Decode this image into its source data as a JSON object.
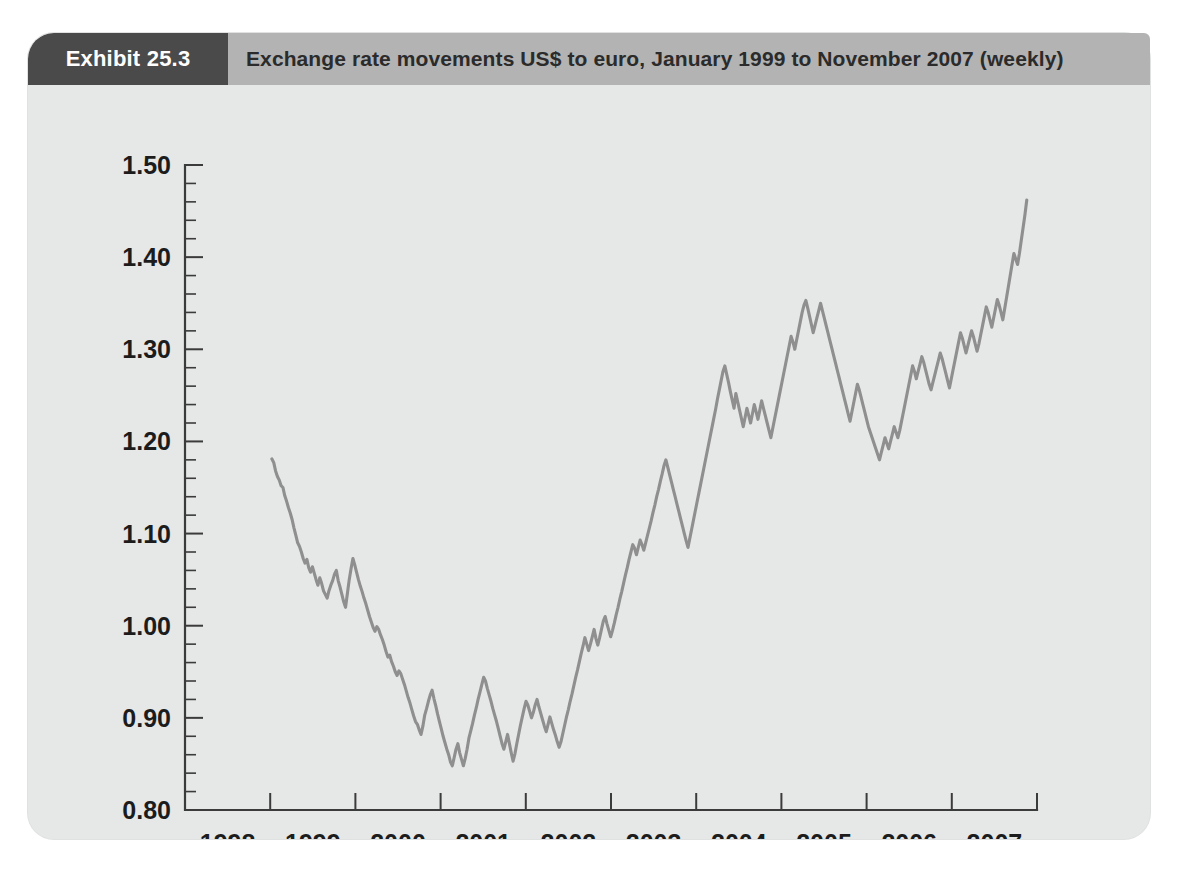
{
  "exhibit": {
    "tag_label": "Exhibit 25.3",
    "title": "Exchange rate movements US$ to euro, January 1999 to November 2007 (weekly)",
    "tag_background": "#4a4a4a",
    "header_background": "#b3b3b3",
    "panel_background": "#e6e7e7"
  },
  "chart_data": {
    "type": "line",
    "title": "Exchange rate movements US$ to euro, January 1999 to November 2007 (weekly)",
    "xlabel": "",
    "ylabel": "",
    "grid": false,
    "legend": null,
    "line_color": "#8f8f8f",
    "axis_color": "#3b3b3b",
    "xlim": [
      1998.0,
      2008.0
    ],
    "ylim": [
      0.8,
      1.5
    ],
    "x_tick_labels": [
      "1998",
      "1999",
      "2000",
      "2001",
      "2002",
      "2003",
      "2004",
      "2005",
      "2006",
      "2007"
    ],
    "x_tick_label_positions": [
      1998.5,
      1999.5,
      2000.5,
      2001.5,
      2002.5,
      2003.5,
      2004.5,
      2005.5,
      2006.5,
      2007.5
    ],
    "x_major_ticks": [
      1998,
      1999,
      2000,
      2001,
      2002,
      2003,
      2004,
      2005,
      2006,
      2007,
      2008
    ],
    "y_tick_labels": [
      "0.80",
      "0.90",
      "1.00",
      "1.10",
      "1.20",
      "1.30",
      "1.40",
      "1.50"
    ],
    "y_major_ticks": [
      0.8,
      0.9,
      1.0,
      1.1,
      1.2,
      1.3,
      1.4,
      1.5
    ],
    "y_minor_tick_step": 0.02,
    "series_name": "US$ per euro",
    "x_start": 1999.02,
    "x_end": 2007.88,
    "values": [
      1.181,
      1.177,
      1.168,
      1.162,
      1.158,
      1.152,
      1.15,
      1.141,
      1.135,
      1.128,
      1.122,
      1.115,
      1.106,
      1.098,
      1.09,
      1.086,
      1.08,
      1.073,
      1.068,
      1.072,
      1.063,
      1.058,
      1.064,
      1.057,
      1.05,
      1.044,
      1.052,
      1.046,
      1.038,
      1.034,
      1.03,
      1.038,
      1.044,
      1.049,
      1.056,
      1.06,
      1.049,
      1.042,
      1.034,
      1.026,
      1.02,
      1.035,
      1.05,
      1.062,
      1.073,
      1.066,
      1.058,
      1.05,
      1.043,
      1.037,
      1.03,
      1.024,
      1.017,
      1.01,
      1.004,
      0.998,
      0.994,
      0.999,
      0.996,
      0.99,
      0.985,
      0.979,
      0.972,
      0.966,
      0.968,
      0.961,
      0.956,
      0.95,
      0.946,
      0.951,
      0.948,
      0.942,
      0.936,
      0.929,
      0.922,
      0.916,
      0.909,
      0.902,
      0.896,
      0.893,
      0.887,
      0.882,
      0.891,
      0.903,
      0.91,
      0.918,
      0.925,
      0.93,
      0.921,
      0.913,
      0.904,
      0.896,
      0.888,
      0.88,
      0.873,
      0.866,
      0.86,
      0.852,
      0.848,
      0.857,
      0.866,
      0.872,
      0.862,
      0.855,
      0.848,
      0.856,
      0.866,
      0.878,
      0.886,
      0.894,
      0.903,
      0.911,
      0.92,
      0.928,
      0.936,
      0.944,
      0.94,
      0.932,
      0.925,
      0.918,
      0.91,
      0.903,
      0.896,
      0.888,
      0.88,
      0.872,
      0.866,
      0.874,
      0.882,
      0.872,
      0.862,
      0.853,
      0.861,
      0.872,
      0.882,
      0.892,
      0.901,
      0.91,
      0.918,
      0.914,
      0.907,
      0.9,
      0.906,
      0.914,
      0.92,
      0.912,
      0.905,
      0.898,
      0.891,
      0.885,
      0.893,
      0.901,
      0.894,
      0.887,
      0.881,
      0.874,
      0.868,
      0.874,
      0.883,
      0.892,
      0.901,
      0.909,
      0.918,
      0.926,
      0.935,
      0.944,
      0.952,
      0.961,
      0.97,
      0.978,
      0.987,
      0.98,
      0.973,
      0.98,
      0.988,
      0.996,
      0.986,
      0.979,
      0.987,
      0.996,
      1.005,
      1.01,
      1.002,
      0.995,
      0.988,
      0.995,
      1.003,
      1.012,
      1.02,
      1.029,
      1.037,
      1.046,
      1.055,
      1.063,
      1.072,
      1.08,
      1.088,
      1.084,
      1.077,
      1.085,
      1.093,
      1.088,
      1.082,
      1.09,
      1.098,
      1.106,
      1.114,
      1.123,
      1.131,
      1.14,
      1.148,
      1.157,
      1.165,
      1.174,
      1.18,
      1.172,
      1.164,
      1.156,
      1.148,
      1.14,
      1.132,
      1.124,
      1.116,
      1.108,
      1.1,
      1.092,
      1.085,
      1.095,
      1.105,
      1.115,
      1.125,
      1.135,
      1.145,
      1.155,
      1.165,
      1.175,
      1.185,
      1.195,
      1.205,
      1.215,
      1.225,
      1.235,
      1.246,
      1.256,
      1.266,
      1.276,
      1.282,
      1.273,
      1.264,
      1.254,
      1.245,
      1.236,
      1.252,
      1.243,
      1.234,
      1.225,
      1.216,
      1.226,
      1.236,
      1.228,
      1.22,
      1.23,
      1.24,
      1.232,
      1.224,
      1.234,
      1.244,
      1.236,
      1.228,
      1.22,
      1.212,
      1.204,
      1.214,
      1.224,
      1.234,
      1.244,
      1.254,
      1.264,
      1.274,
      1.284,
      1.294,
      1.304,
      1.314,
      1.308,
      1.3,
      1.31,
      1.32,
      1.33,
      1.34,
      1.348,
      1.353,
      1.345,
      1.336,
      1.327,
      1.318,
      1.326,
      1.334,
      1.342,
      1.35,
      1.342,
      1.334,
      1.326,
      1.318,
      1.31,
      1.302,
      1.294,
      1.286,
      1.278,
      1.27,
      1.262,
      1.254,
      1.246,
      1.238,
      1.23,
      1.222,
      1.232,
      1.242,
      1.252,
      1.262,
      1.256,
      1.248,
      1.24,
      1.232,
      1.224,
      1.216,
      1.21,
      1.204,
      1.198,
      1.192,
      1.186,
      1.18,
      1.188,
      1.196,
      1.204,
      1.198,
      1.192,
      1.2,
      1.208,
      1.216,
      1.21,
      1.204,
      1.212,
      1.222,
      1.232,
      1.242,
      1.252,
      1.262,
      1.272,
      1.282,
      1.276,
      1.268,
      1.276,
      1.284,
      1.292,
      1.286,
      1.278,
      1.27,
      1.262,
      1.256,
      1.264,
      1.272,
      1.28,
      1.288,
      1.296,
      1.29,
      1.282,
      1.274,
      1.266,
      1.258,
      1.268,
      1.278,
      1.288,
      1.298,
      1.308,
      1.318,
      1.312,
      1.304,
      1.296,
      1.304,
      1.312,
      1.32,
      1.314,
      1.306,
      1.298,
      1.306,
      1.316,
      1.326,
      1.336,
      1.346,
      1.34,
      1.332,
      1.324,
      1.334,
      1.344,
      1.354,
      1.348,
      1.34,
      1.332,
      1.344,
      1.356,
      1.368,
      1.38,
      1.392,
      1.404,
      1.398,
      1.392,
      1.404,
      1.418,
      1.432,
      1.446,
      1.462
    ]
  }
}
